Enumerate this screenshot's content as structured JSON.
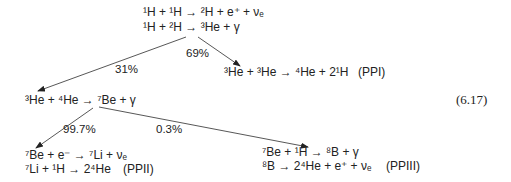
{
  "diagram": {
    "type": "reaction-chain",
    "equation_number": "(6.17)",
    "nodes": {
      "initial": {
        "lines": [
          {
            "parts": [
              {
                "sup": "1"
              },
              {
                "t": "H + "
              },
              {
                "sup": "1"
              },
              {
                "t": "H → "
              },
              {
                "sup": "2"
              },
              {
                "t": "H + e"
              },
              {
                "sup": "+"
              },
              {
                "t": " + ν"
              },
              {
                "sub": "e"
              }
            ]
          },
          {
            "parts": [
              {
                "sup": "1"
              },
              {
                "t": "H + "
              },
              {
                "sup": "2"
              },
              {
                "t": "H → "
              },
              {
                "sup": "3"
              },
              {
                "t": "He + γ"
              }
            ]
          }
        ],
        "text": [
          "¹H + ¹H → ²H + e⁺ + νₑ",
          "¹H + ²H → ³He + γ"
        ]
      },
      "ppi": {
        "text": [
          "³He + ³He → ⁴He + 2¹H"
        ],
        "label": "(PPI)"
      },
      "he3_he4": {
        "text": [
          "³He + ⁴He → ⁷Be + γ"
        ]
      },
      "ppii": {
        "text": [
          "⁷Be + e⁻ → ⁷Li + νₑ",
          "⁷Li + ¹H → 2⁴He"
        ],
        "label": "(PPII)"
      },
      "ppiii": {
        "text": [
          "⁷Be + ¹H → ⁸B + γ",
          "⁸B → 2⁴He + e⁺ + νₑ"
        ],
        "label": "(PPIII)"
      }
    },
    "edges": [
      {
        "from": "initial",
        "to": "he3_he4",
        "label": "31%"
      },
      {
        "from": "initial",
        "to": "ppi",
        "label": "69%"
      },
      {
        "from": "he3_he4",
        "to": "ppii",
        "label": "99.7%"
      },
      {
        "from": "he3_he4",
        "to": "ppiii",
        "label": "0.3%"
      }
    ],
    "colors": {
      "text": "#222222",
      "line": "#333333",
      "background": "#ffffff"
    }
  }
}
